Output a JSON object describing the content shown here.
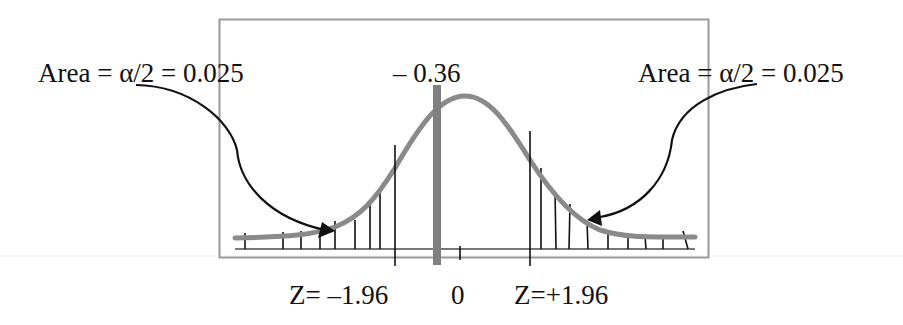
{
  "diagram": {
    "left_area_label": "Area = α/2 = 0.025",
    "right_area_label": "Area = α/2 = 0.025",
    "test_statistic_label": "– 0.36",
    "left_critical_label": "Z= –1.96",
    "zero_label": "0",
    "right_critical_label": "Z=+1.96",
    "colors": {
      "curve": "#8a8a8a",
      "statistic_bar": "#7f7f7f",
      "box": "#9a9a9a",
      "lines": "#111111"
    }
  }
}
